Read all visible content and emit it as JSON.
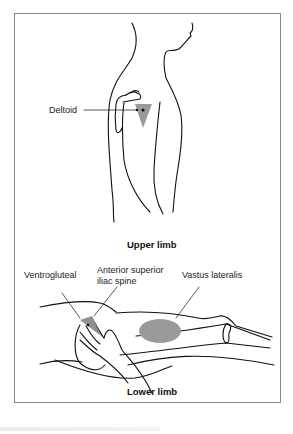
{
  "figure": {
    "upper_panel": {
      "title": "Upper limb",
      "labels": {
        "deltoid": "Deltoid"
      }
    },
    "lower_panel": {
      "title": "Lower limb",
      "labels": {
        "ventrogluteal": "Ventrogluteal",
        "anterior_superior_line1": "Anterior superior",
        "anterior_superior_line2": "iliac spine",
        "vastus_lateralis": "Vastus lateralis"
      }
    },
    "colors": {
      "outline": "#111111",
      "injection_site_fill": "#9a9a9a",
      "frame_border": "#8a8a8a"
    }
  }
}
